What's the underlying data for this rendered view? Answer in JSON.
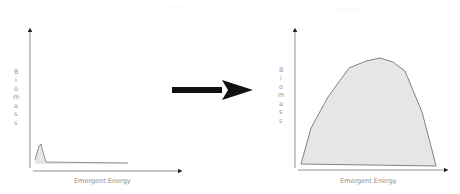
{
  "diagram": {
    "left_panel": {
      "title": "",
      "x_label": "Emergent Energy",
      "y_label_letters": [
        "B",
        "i",
        "o",
        "m",
        "a",
        "s",
        "s"
      ],
      "curve_description": "narrow tall spike at low emergent energy, then flat low biomass",
      "fill_color": "#e6e6e6",
      "stroke_color": "#777777"
    },
    "arrow": {
      "direction": "right",
      "color": "#111111",
      "meaning": "transition"
    },
    "right_panel": {
      "title": "",
      "x_label": "Emergent Energy",
      "y_label_letters": [
        "B",
        "i",
        "o",
        "m",
        "a",
        "s",
        "s"
      ],
      "curve_description": "broad hump of high biomass across emergent energy range",
      "fill_color": "#e6e6e6",
      "stroke_color": "#666666"
    },
    "axis_color": "#777777"
  }
}
